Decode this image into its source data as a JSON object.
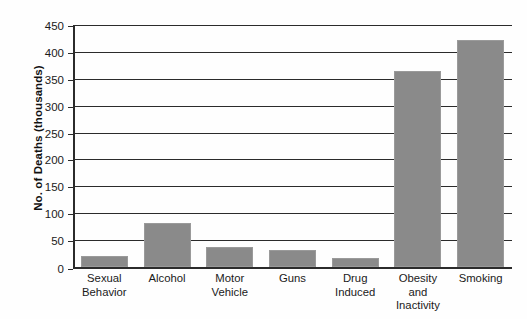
{
  "chart_data": {
    "type": "bar",
    "title": "",
    "xlabel": "",
    "ylabel": "No. of Deaths (thousands)",
    "ylim": [
      0,
      450
    ],
    "ytick_step": 50,
    "grid": true,
    "legend": "none",
    "bar_color": "#8a8a8a",
    "categories": [
      "Sexual Behavior",
      "Alcohol",
      "Motor Vehicle",
      "Guns",
      "Drug Induced",
      "Obesity and Inactivity",
      "Smoking"
    ],
    "category_label_lines": [
      [
        "Sexual",
        "Behavior"
      ],
      [
        "Alcohol"
      ],
      [
        "Motor",
        "Vehicle"
      ],
      [
        "Guns"
      ],
      [
        "Drug",
        "Induced"
      ],
      [
        "Obesity",
        "and",
        "Inactivity"
      ],
      [
        "Smoking"
      ]
    ],
    "values": [
      20,
      82,
      38,
      32,
      17,
      365,
      422
    ],
    "ytick_labels": [
      "450",
      "400",
      "350",
      "300",
      "250",
      "200",
      "150",
      "100",
      "50",
      "0"
    ],
    "ytick_values": [
      450,
      400,
      350,
      300,
      250,
      200,
      150,
      100,
      50,
      0
    ]
  }
}
